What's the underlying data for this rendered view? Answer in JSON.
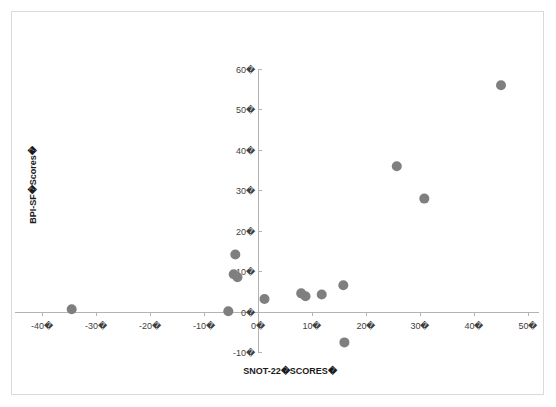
{
  "chart_data": {
    "type": "scatter",
    "title": "",
    "xlabel": "SNOT-22�SCORES�",
    "ylabel": "BPI-SF�Scores�",
    "xlim": [
      -45,
      52
    ],
    "ylim": [
      -10,
      60
    ],
    "xticks": [
      -40,
      -30,
      -20,
      -10,
      0,
      10,
      20,
      30,
      40,
      50
    ],
    "yticks": [
      -10,
      0,
      10,
      20,
      30,
      40,
      50,
      60
    ],
    "xtick_labels": [
      "-40�",
      "-30�",
      "-20�",
      "-10�",
      "0�",
      "10�",
      "20�",
      "30�",
      "40�",
      "50�"
    ],
    "ytick_labels": [
      "-10�",
      "0�",
      "10�",
      "20�",
      "30�",
      "40�",
      "50�",
      "60�"
    ],
    "grid": false,
    "legend": false,
    "marker_color": "#7f7f7f",
    "marker_size": 5,
    "points": [
      {
        "x": -34.5,
        "y": 0.7
      },
      {
        "x": -5.5,
        "y": 0.2
      },
      {
        "x": -4.2,
        "y": 14.2
      },
      {
        "x": -4.5,
        "y": 9.3
      },
      {
        "x": -3.8,
        "y": 8.6
      },
      {
        "x": 1.2,
        "y": 3.2
      },
      {
        "x": 8.0,
        "y": 4.6
      },
      {
        "x": 8.8,
        "y": 3.9
      },
      {
        "x": 11.8,
        "y": 4.3
      },
      {
        "x": 15.8,
        "y": 6.6
      },
      {
        "x": 16.0,
        "y": -7.5
      },
      {
        "x": 25.7,
        "y": 36.0
      },
      {
        "x": 30.8,
        "y": 28.0
      },
      {
        "x": 45.0,
        "y": 56.0
      }
    ]
  },
  "axis_titles": {
    "x": "SNOT-22�SCORES�",
    "y": "BPI-SF�Scores�"
  },
  "colors": {
    "marker": "#7f7f7f",
    "axis": "#b3b3b3",
    "border": "#d9d9d9",
    "tick_text": "#3f3f3f",
    "title_text": "#1a1a1a",
    "background": "#ffffff"
  }
}
